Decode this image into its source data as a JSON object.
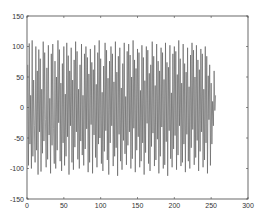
{
  "chart_data": {
    "type": "line",
    "title": "",
    "xlabel": "",
    "ylabel": "",
    "xlim": [
      0,
      300
    ],
    "ylim": [
      -150,
      150
    ],
    "xticks": [
      0,
      50,
      100,
      150,
      200,
      250,
      300
    ],
    "yticks": [
      150,
      100,
      50,
      0,
      -50,
      -100,
      -150
    ],
    "xtick_labels": [
      "0",
      "50",
      "100",
      "150",
      "200",
      "250",
      "300"
    ],
    "ytick_labels": [
      "150",
      "100",
      "50",
      "0",
      "-50",
      "-100",
      "-150"
    ],
    "grid": false,
    "legend": null,
    "line_color": "#555555",
    "series": [
      {
        "name": "signal",
        "x_start": 1,
        "x_step": 1,
        "values": [
          70,
          -95,
          105,
          -60,
          20,
          -100,
          110,
          -80,
          45,
          -30,
          -90,
          100,
          -70,
          60,
          -110,
          95,
          -40,
          80,
          -105,
          30,
          -75,
          108,
          -55,
          90,
          -20,
          -98,
          65,
          -85,
          102,
          -45,
          15,
          -108,
          88,
          -62,
          104,
          -35,
          -92,
          76,
          -100,
          50,
          -70,
          110,
          -25,
          95,
          -88,
          40,
          -104,
          72,
          -58,
          100,
          -95,
          22,
          -80,
          106,
          -48,
          85,
          -110,
          60,
          -30,
          98,
          -90,
          45,
          -102,
          78,
          -65,
          108,
          -40,
          92,
          -85,
          30,
          -100,
          70,
          -55,
          104,
          -78,
          20,
          -95,
          88,
          -68,
          100,
          -35,
          82,
          -106,
          55,
          -90,
          96,
          -28,
          74,
          -108,
          62,
          -45,
          102,
          -82,
          38,
          -98,
          90,
          -60,
          110,
          -50,
          80,
          -92,
          25,
          -104,
          68,
          -72,
          106,
          -38,
          94,
          -86,
          48,
          -110,
          76,
          -58,
          100,
          -30,
          88,
          -96,
          42,
          -80,
          108,
          -66,
          58,
          -112,
          84,
          -44,
          98,
          -88,
          32,
          -102,
          72,
          -54,
          106,
          -76,
          18,
          -94,
          92,
          -62,
          104,
          -40,
          86,
          -100,
          50,
          -84,
          110,
          -34,
          78,
          -106,
          64,
          -70,
          96,
          -48,
          90,
          -98,
          28,
          -88,
          102,
          -58,
          82,
          -110,
          44,
          -74,
          100,
          -26,
          94,
          -92,
          56,
          -104,
          70,
          -64,
          108,
          -42,
          84,
          -96,
          36,
          -86,
          104,
          -52,
          76,
          -108,
          60,
          -80,
          98,
          -32,
          90,
          -100,
          46,
          -94,
          106,
          -56,
          74,
          -112,
          66,
          -38,
          102,
          -84,
          24,
          -98,
          88,
          -68,
          100,
          -46,
          92,
          -102,
          54,
          -78,
          110,
          -30,
          80,
          -96,
          40,
          -90,
          104,
          -60,
          72,
          -106,
          58,
          -44,
          98,
          -88,
          34,
          -100,
          86,
          -66,
          106,
          -36,
          94,
          -94,
          50,
          -82,
          102,
          -54,
          78,
          -104,
          62,
          -72,
          96,
          -40,
          88,
          -98,
          30,
          -86,
          100,
          -58,
          84,
          -108,
          52,
          -20,
          70,
          -95,
          40,
          -60,
          10,
          -30,
          60,
          -5,
          20
        ]
      }
    ]
  }
}
